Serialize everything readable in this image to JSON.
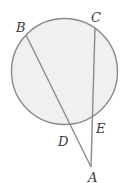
{
  "diagram": {
    "type": "circle-secants",
    "colors": {
      "circle_fill": "#f0f0f0",
      "stroke": "#8a8a8a",
      "label": "#3a3a3a"
    },
    "circle": {
      "cx": 64.5,
      "cy": 71.5,
      "r": 53
    },
    "points": {
      "A": {
        "label": "A",
        "x": 91,
        "y": 167
      },
      "B": {
        "label": "B",
        "x": 26,
        "y": 35
      },
      "C": {
        "label": "C",
        "x": 95,
        "y": 28
      },
      "D": {
        "label": "D",
        "x": 71,
        "y": 127
      },
      "E": {
        "label": "E",
        "x": 93,
        "y": 117
      }
    },
    "labels": {
      "A": {
        "text": "A",
        "x": 88,
        "y": 182
      },
      "B": {
        "text": "B",
        "x": 16,
        "y": 32
      },
      "C": {
        "text": "C",
        "x": 91,
        "y": 22
      },
      "D": {
        "text": "D",
        "x": 58,
        "y": 146
      },
      "E": {
        "text": "E",
        "x": 96,
        "y": 133
      }
    },
    "segments": [
      {
        "from": "B",
        "to": "A"
      },
      {
        "from": "C",
        "to": "A"
      }
    ]
  }
}
